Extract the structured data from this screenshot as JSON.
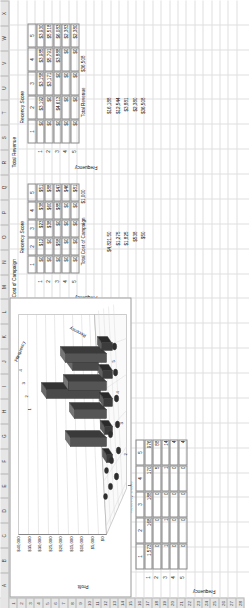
{
  "app": {
    "type": "spreadsheet",
    "orientation": "rotated-90-ccw"
  },
  "grid": {
    "column_letters": [
      "A",
      "B",
      "C",
      "D",
      "E",
      "F",
      "G",
      "H",
      "I",
      "J",
      "K",
      "L",
      "M",
      "N",
      "O",
      "P",
      "Q",
      "R",
      "S",
      "T",
      "U",
      "V",
      "W",
      "X"
    ],
    "row_numbers": [
      "1",
      "2",
      "3",
      "4",
      "5",
      "6",
      "7",
      "8",
      "9",
      "10",
      "11",
      "12",
      "13",
      "14",
      "15",
      "16",
      "17",
      "18",
      "19",
      "20",
      "21",
      "22",
      "23",
      "24",
      "25",
      "26",
      "27",
      "28"
    ]
  },
  "params": {
    "budget_label": "Budget $=",
    "budget_value": "$  1,000",
    "cost_label": "Cost to Reach:",
    "cost_value": "$     7.50"
  },
  "blocks": {
    "profit_matrix": {
      "title": "Recency Score",
      "side_label": "Frequency",
      "col_headers": [
        "1",
        "2",
        "3",
        "4",
        "5"
      ],
      "row_headers": [
        "1",
        "2",
        "3",
        "4",
        "5"
      ],
      "rows": [
        [
          "$48",
          "$3,192",
          "$3,158",
          "$3,985",
          "$3,930"
        ],
        [
          "$0",
          "$0",
          "$5,565",
          "$5,791",
          "$6,960"
        ],
        [
          "$0",
          "$6,795",
          "$0",
          "$2,3008",
          "$5,985"
        ],
        [
          "$0",
          "$0",
          "$0",
          "$0",
          "$1,325"
        ],
        [
          "$0",
          "$0",
          "$0",
          "$0",
          "$1,837"
        ]
      ]
    },
    "decision_variables": {
      "title": "Decision Variables",
      "recency_header": "Recency Score",
      "side_label": "Frequency",
      "col_headers": [
        "1",
        "2",
        "3",
        "4",
        "5"
      ],
      "row_headers": [
        "1",
        "2",
        "3",
        "4",
        "5"
      ],
      "rows": [
        [
          "0",
          "1",
          "1",
          "1",
          "1"
        ],
        [
          "0",
          "0",
          "1",
          "1",
          "1"
        ],
        [
          "0",
          "1",
          "0",
          "1",
          "1"
        ],
        [
          "0",
          "0",
          "0",
          "0",
          "1"
        ],
        [
          "0",
          "0",
          "0",
          "0",
          "1"
        ]
      ]
    },
    "cost_of_campaign": {
      "title": "Cost of Campaign",
      "recency_header": "Recency Score",
      "side_label": "Frequency",
      "col_headers": [
        "1",
        "2",
        "3",
        "4",
        "5"
      ],
      "row_headers": [
        "1",
        "2",
        "3",
        "4",
        "5"
      ],
      "rows": [
        [
          "$0",
          "$12",
          "$23",
          "$38",
          "$51"
        ],
        [
          "$0",
          "$0",
          "$38",
          "$60",
          "$88"
        ],
        [
          "$0",
          "$58",
          "$0",
          "$85",
          "$47"
        ],
        [
          "$0",
          "$0",
          "$0",
          "$0",
          "$46"
        ],
        [
          "$0",
          "$0",
          "$0",
          "$0",
          "$81"
        ]
      ],
      "total_label": "Total Cost of Campaign",
      "total_value": "$1,000"
    },
    "total_revenue": {
      "title": "Total Revenue",
      "recency_header": "Recency Score",
      "side_label": "Frequency",
      "col_headers": [
        "1",
        "2",
        "3",
        "4",
        "5"
      ],
      "row_headers": [
        "1",
        "2",
        "3",
        "4",
        "5"
      ],
      "rows": [
        [
          "$0",
          "$3,192",
          "$3,158",
          "$3,985",
          "$3,930"
        ],
        [
          "$0",
          "$0",
          "$3,171",
          "$5,791",
          "$5,518"
        ],
        [
          "$0",
          "$4,613",
          "$0",
          "$3,888",
          "$6,083"
        ],
        [
          "$0",
          "$0",
          "$0",
          "$0",
          "$2,383"
        ],
        [
          "$0",
          "$0",
          "$0",
          "$0",
          "$2,380"
        ]
      ],
      "total_label": "Total Revenue",
      "total_value": "$36,508"
    },
    "mailed_counts": {
      "title": "Recency Score",
      "side_label": "Frequency",
      "col_headers": [
        "1",
        "2",
        "3",
        "4",
        "5"
      ],
      "row_headers": [
        "1",
        "2",
        "3",
        "4",
        "5"
      ],
      "rows": [
        [
          "1,573",
          "168",
          "188",
          "170",
          "976"
        ],
        [
          "0",
          "0",
          "0",
          "5",
          "88"
        ],
        [
          "1",
          "1",
          "0",
          "1",
          "14"
        ],
        [
          "0",
          "0",
          "0",
          "0",
          "4"
        ],
        [
          "0",
          "0",
          "0",
          "0",
          "4"
        ]
      ]
    }
  },
  "profit_summary": {
    "label": "Profit",
    "values": [
      "$4,821.50",
      "$1,275",
      "$1,825",
      "$538",
      "$50"
    ],
    "extra": [
      "$16,188",
      "$12,544",
      "$3,881",
      "$2,380",
      "$36,508"
    ]
  },
  "chart_data": {
    "type": "bar",
    "render": "3d-surface-bar",
    "title": "",
    "xlabel": "Recency",
    "ylabel": "Profit",
    "zlabel": "Frequency",
    "x_ticks": [
      "1",
      "2",
      "3",
      "4",
      "5"
    ],
    "z_ticks": [
      "1",
      "2",
      "3",
      "4",
      "5"
    ],
    "y_ticks": [
      "$0",
      "$5,000",
      "$10,000",
      "$15,000",
      "$20,000",
      "$25,000",
      "$30,000",
      "$35,000",
      "$40,000"
    ],
    "ylim": [
      0,
      40000
    ],
    "grid": true,
    "legend": "none",
    "categories": [
      "1",
      "2",
      "3",
      "4",
      "5"
    ],
    "series": [
      {
        "name": "Frequency 1",
        "values": [
          48,
          3192,
          3158,
          3985,
          3930
        ]
      },
      {
        "name": "Frequency 2",
        "values": [
          0,
          0,
          5565,
          5791,
          6960
        ]
      },
      {
        "name": "Frequency 3",
        "values": [
          0,
          6795,
          0,
          23008,
          5985
        ]
      },
      {
        "name": "Frequency 4",
        "values": [
          0,
          0,
          0,
          0,
          1325
        ]
      },
      {
        "name": "Frequency 5",
        "values": [
          0,
          0,
          0,
          0,
          1837
        ]
      }
    ]
  }
}
